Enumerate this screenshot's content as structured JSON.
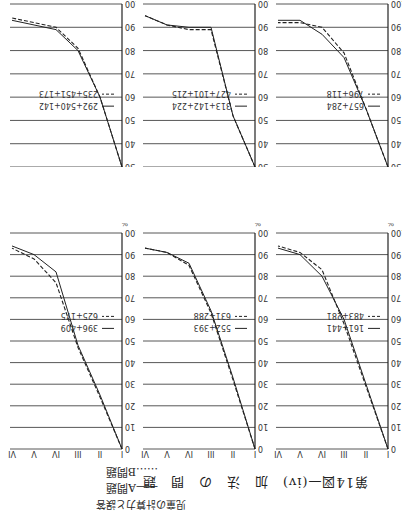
{
  "page": {
    "running_head": "児童の計算力と誤答",
    "figure_title": "第14図—(iv)",
    "figure_subtitle": "加　法　の　問　題",
    "legend": [
      {
        "style": "solid",
        "label": "A問題",
        "marker": "——"
      },
      {
        "style": "dotted",
        "label": "B問題",
        "marker": "……"
      }
    ],
    "y_unit": "%"
  },
  "chart_data": [
    {
      "type": "line",
      "title": "",
      "x": [
        "I",
        "II",
        "III",
        "IV",
        "V",
        "VI"
      ],
      "xlabel": "",
      "ylabel": "%",
      "ylim": [
        0,
        100
      ],
      "y_inverted": true,
      "yticks": [
        0,
        10,
        20,
        30,
        40,
        50,
        60,
        70,
        80,
        90,
        100
      ],
      "series": [
        {
          "name": "161+441",
          "style": "solid",
          "values": [
            0,
            30,
            60,
            80,
            90,
            93
          ]
        },
        {
          "name": "483+281",
          "style": "dashed",
          "values": [
            0,
            29,
            58,
            83,
            91,
            94
          ]
        }
      ]
    },
    {
      "type": "line",
      "title": "",
      "x": [
        "I",
        "II",
        "III",
        "IV",
        "V",
        "VI"
      ],
      "xlabel": "",
      "ylabel": "%",
      "ylim": [
        0,
        100
      ],
      "y_inverted": true,
      "yticks": [
        0,
        10,
        20,
        30,
        40,
        50,
        60,
        70,
        80,
        90,
        100
      ],
      "series": [
        {
          "name": "552+393",
          "style": "solid",
          "values": [
            0,
            33,
            64,
            86,
            91,
            93
          ]
        },
        {
          "name": "631+288",
          "style": "dashed",
          "values": [
            0,
            32,
            63,
            85,
            91,
            93
          ]
        }
      ]
    },
    {
      "type": "line",
      "title": "",
      "x": [
        "I",
        "II",
        "III",
        "IV",
        "V",
        "VI"
      ],
      "xlabel": "",
      "ylabel": "%",
      "ylim": [
        0,
        100
      ],
      "y_inverted": true,
      "yticks": [
        0,
        10,
        20,
        30,
        40,
        50,
        60,
        70,
        80,
        90,
        100
      ],
      "series": [
        {
          "name": "396+409",
          "style": "solid",
          "values": [
            0,
            25,
            48,
            82,
            90,
            94
          ]
        },
        {
          "name": "625+175",
          "style": "dashed",
          "values": [
            0,
            24,
            47,
            77,
            88,
            93
          ]
        }
      ]
    },
    {
      "type": "line",
      "title": "",
      "x": [
        "I",
        "II",
        "III",
        "IV",
        "V",
        "VI"
      ],
      "xlabel": "",
      "ylabel": "%",
      "ylim": [
        30,
        100
      ],
      "y_inverted": true,
      "yticks": [
        30,
        40,
        50,
        60,
        70,
        80,
        90,
        100
      ],
      "series": [
        {
          "name": "657+284",
          "style": "solid",
          "values": [
            30,
            55,
            77,
            87,
            93,
            93
          ]
        },
        {
          "name": "796+118",
          "style": "dashed",
          "values": [
            30,
            55,
            79,
            90,
            92,
            92
          ]
        }
      ]
    },
    {
      "type": "line",
      "title": "",
      "x": [
        "I",
        "II",
        "III",
        "IV",
        "V",
        "VI"
      ],
      "xlabel": "",
      "ylabel": "%",
      "ylim": [
        30,
        100
      ],
      "y_inverted": true,
      "yticks": [
        30,
        40,
        50,
        60,
        70,
        80,
        90,
        100
      ],
      "series": [
        {
          "name": "313+142+224",
          "style": "solid",
          "values": [
            30,
            52,
            90,
            90,
            91,
            95
          ]
        },
        {
          "name": "427+101+215",
          "style": "dashed",
          "values": [
            30,
            52,
            89,
            89,
            91,
            95
          ]
        }
      ]
    },
    {
      "type": "line",
      "title": "",
      "x": [
        "I",
        "II",
        "III",
        "IV",
        "V",
        "VI"
      ],
      "xlabel": "",
      "ylabel": "%",
      "ylim": [
        30,
        100
      ],
      "y_inverted": true,
      "yticks": [
        30,
        40,
        50,
        60,
        70,
        80,
        90,
        100
      ],
      "series": [
        {
          "name": "292+540+142",
          "style": "solid",
          "values": [
            30,
            60,
            80,
            89,
            91,
            93
          ]
        },
        {
          "name": "235+451+173",
          "style": "dashed",
          "values": [
            30,
            60,
            81,
            90,
            92,
            94
          ]
        }
      ]
    }
  ]
}
